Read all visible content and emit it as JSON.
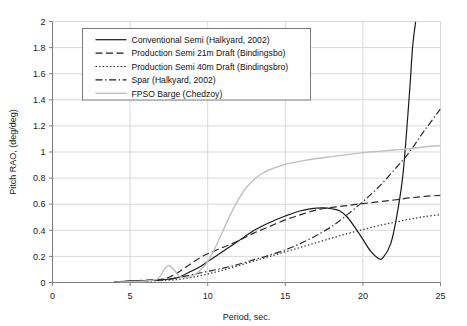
{
  "chart_data": {
    "type": "line",
    "title": "",
    "xlabel": "Period, sec.",
    "ylabel": "Pitch RAO, (deg/deg)",
    "xlim": [
      0,
      25
    ],
    "ylim": [
      0,
      2
    ],
    "xticks": [
      0,
      5,
      10,
      15,
      20,
      25
    ],
    "yticks": [
      0,
      0.2,
      0.4,
      0.6,
      0.8,
      1,
      1.2,
      1.4,
      1.6,
      1.8,
      2
    ],
    "xtick_labels": [
      "0",
      "5",
      "10",
      "15",
      "20",
      "25"
    ],
    "ytick_labels": [
      "0",
      "0.2",
      "0.4",
      "0.6",
      "0.8",
      "1",
      "1.2",
      "1.4",
      "1.6",
      "1.8",
      "2"
    ],
    "grid": "horizontal-and-vertical",
    "legend_position": "upper-left-inside",
    "series": [
      {
        "name": "Conventional Semi (Halkyard, 2002)",
        "style": "solid",
        "color": "#1a1a1a",
        "x": [
          4.0,
          5.0,
          6.0,
          7.0,
          7.5,
          8.0,
          8.5,
          9.0,
          9.5,
          10.0,
          10.5,
          11.0,
          11.5,
          12.0,
          13.0,
          14.0,
          15.0,
          16.0,
          17.0,
          17.5,
          18.0,
          18.5,
          19.0,
          19.5,
          20.0,
          20.5,
          21.0,
          21.3,
          21.8,
          22.2,
          22.6,
          23.0,
          23.2,
          23.4
        ],
        "y": [
          0.005,
          0.01,
          0.015,
          0.02,
          0.025,
          0.035,
          0.06,
          0.09,
          0.12,
          0.16,
          0.2,
          0.24,
          0.28,
          0.32,
          0.4,
          0.46,
          0.51,
          0.55,
          0.57,
          0.572,
          0.565,
          0.55,
          0.5,
          0.42,
          0.33,
          0.24,
          0.185,
          0.19,
          0.3,
          0.52,
          0.85,
          1.45,
          1.8,
          2.0
        ]
      },
      {
        "name": "Production Semi 21m Draft (Bindingsbo)",
        "style": "dashed",
        "color": "#2b2b2b",
        "x": [
          4.0,
          5.0,
          6.0,
          7.0,
          7.5,
          8.0,
          8.5,
          9.0,
          9.5,
          10.0,
          11.0,
          12.0,
          13.0,
          14.0,
          15.0,
          16.0,
          17.0,
          18.0,
          19.0,
          20.0,
          21.0,
          22.0,
          23.0,
          24.0,
          25.0
        ],
        "y": [
          0.005,
          0.01,
          0.018,
          0.025,
          0.04,
          0.07,
          0.11,
          0.15,
          0.19,
          0.22,
          0.27,
          0.32,
          0.38,
          0.43,
          0.48,
          0.52,
          0.555,
          0.575,
          0.59,
          0.605,
          0.618,
          0.632,
          0.648,
          0.66,
          0.668
        ]
      },
      {
        "name": "Production Semi 40m Draft (Bindingsbro)",
        "style": "dotted",
        "color": "#333333",
        "x": [
          4.0,
          5.0,
          6.0,
          7.0,
          8.0,
          9.0,
          10.0,
          11.0,
          12.0,
          13.0,
          14.0,
          15.0,
          16.0,
          17.0,
          18.0,
          19.0,
          20.0,
          21.0,
          22.0,
          23.0,
          24.0,
          25.0
        ],
        "y": [
          0.003,
          0.006,
          0.01,
          0.015,
          0.022,
          0.04,
          0.065,
          0.095,
          0.13,
          0.165,
          0.2,
          0.235,
          0.27,
          0.305,
          0.34,
          0.375,
          0.405,
          0.435,
          0.46,
          0.485,
          0.505,
          0.52
        ]
      },
      {
        "name": "Spar (Halkyard, 2002)",
        "style": "dashdot",
        "color": "#2b2b2b",
        "x": [
          4.0,
          5.0,
          6.0,
          7.0,
          8.0,
          9.0,
          10.0,
          11.0,
          12.0,
          13.0,
          14.0,
          15.0,
          16.0,
          17.0,
          18.0,
          19.0,
          20.0,
          21.0,
          22.0,
          23.0,
          24.0,
          25.0
        ],
        "y": [
          0.004,
          0.008,
          0.014,
          0.02,
          0.035,
          0.06,
          0.085,
          0.11,
          0.14,
          0.175,
          0.21,
          0.25,
          0.3,
          0.36,
          0.43,
          0.52,
          0.62,
          0.73,
          0.86,
          1.0,
          1.17,
          1.33
        ]
      },
      {
        "name": "FPSO Barge (Chedzoy)",
        "style": "solid-light",
        "color": "#bfbfbf",
        "x": [
          4.0,
          5.0,
          6.0,
          6.8,
          7.2,
          7.5,
          7.8,
          8.2,
          8.6,
          9.0,
          9.5,
          10.0,
          10.5,
          11.0,
          11.5,
          12.0,
          12.5,
          13.0,
          13.5,
          14.0,
          15.0,
          16.0,
          17.0,
          18.0,
          19.0,
          20.0,
          21.0,
          22.0,
          23.0,
          24.0,
          25.0
        ],
        "y": [
          0.003,
          0.006,
          0.012,
          0.03,
          0.1,
          0.13,
          0.1,
          0.045,
          0.035,
          0.05,
          0.09,
          0.16,
          0.27,
          0.4,
          0.53,
          0.64,
          0.73,
          0.79,
          0.835,
          0.865,
          0.905,
          0.93,
          0.95,
          0.965,
          0.98,
          0.995,
          1.005,
          1.015,
          1.025,
          1.04,
          1.05
        ]
      }
    ]
  },
  "legend": {
    "items": [
      {
        "label": "Conventional Semi (Halkyard, 2002)",
        "style": "solid"
      },
      {
        "label": "Production Semi 21m Draft (Bindingsbo)",
        "style": "dashed"
      },
      {
        "label": "Production Semi 40m Draft (Bindingsbro)",
        "style": "dotted"
      },
      {
        "label": "Spar (Halkyard, 2002)",
        "style": "dashdot"
      },
      {
        "label": "FPSO Barge (Chedzoy)",
        "style": "solid-light"
      }
    ]
  },
  "colors": {
    "grid": "#d9d9d9",
    "axis": "#808080",
    "text": "#1a1a1a",
    "fpso": "#bfbfbf",
    "dark": "#1a1a1a"
  }
}
